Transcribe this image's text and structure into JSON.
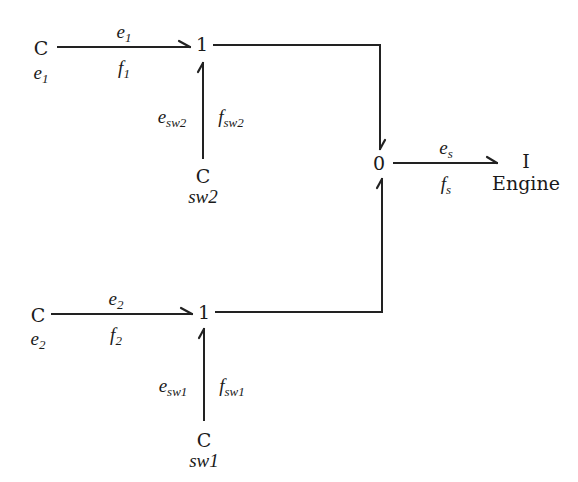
{
  "diagram": {
    "type": "bond-graph",
    "colors": {
      "stroke": "#222222",
      "text": "#1a1a1a",
      "background": "#ffffff"
    },
    "nodes": {
      "c_e1": {
        "label": "C",
        "caption": {
          "base": "e",
          "sub": "1"
        }
      },
      "c_e2": {
        "label": "C",
        "caption": {
          "base": "e",
          "sub": "2"
        }
      },
      "c_sw2": {
        "label": "C",
        "caption": "sw2"
      },
      "c_sw1": {
        "label": "C",
        "caption": "sw1"
      },
      "junction1_top": {
        "label": "1"
      },
      "junction1_bottom": {
        "label": "1"
      },
      "junction0": {
        "label": "0"
      },
      "i_engine": {
        "label": "I",
        "caption": "Engine"
      }
    },
    "bonds": [
      {
        "id": "bond_e1",
        "from": "c_e1",
        "to": "junction1_top",
        "effort": {
          "base": "e",
          "sub": "1"
        },
        "flow": {
          "base": "f",
          "sub": "1"
        }
      },
      {
        "id": "bond_sw2",
        "from": "c_sw2",
        "to": "junction1_top",
        "effort": {
          "base": "e",
          "sub": "sw2"
        },
        "flow": {
          "base": "f",
          "sub": "sw2"
        }
      },
      {
        "id": "bond_top_to_0",
        "from": "junction1_top",
        "to": "junction0"
      },
      {
        "id": "bond_e2",
        "from": "c_e2",
        "to": "junction1_bottom",
        "effort": {
          "base": "e",
          "sub": "2"
        },
        "flow": {
          "base": "f",
          "sub": "2"
        }
      },
      {
        "id": "bond_sw1",
        "from": "c_sw1",
        "to": "junction1_bottom",
        "effort": {
          "base": "e",
          "sub": "sw1"
        },
        "flow": {
          "base": "f",
          "sub": "sw1"
        }
      },
      {
        "id": "bond_bottom_to_0",
        "from": "junction1_bottom",
        "to": "junction0"
      },
      {
        "id": "bond_s",
        "from": "junction0",
        "to": "i_engine",
        "effort": {
          "base": "e",
          "sub": "s"
        },
        "flow": {
          "base": "f",
          "sub": "s"
        }
      }
    ]
  }
}
